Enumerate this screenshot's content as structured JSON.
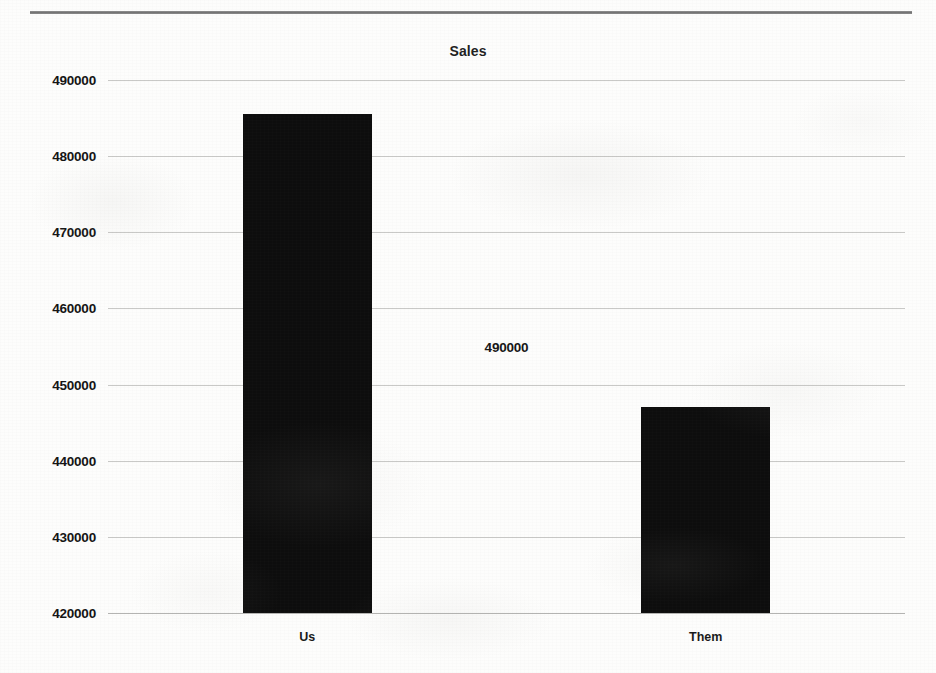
{
  "chart_data": {
    "type": "bar",
    "title": "Sales",
    "categories": [
      "Us",
      "Them"
    ],
    "values": [
      485500,
      447000
    ],
    "xlabel": "",
    "ylabel": "",
    "ylim": [
      420000,
      490000
    ],
    "ytick_labels": [
      "490000",
      "480000",
      "470000",
      "460000",
      "450000",
      "440000",
      "430000",
      "420000"
    ],
    "ytick_values": [
      490000,
      480000,
      470000,
      460000,
      450000,
      440000,
      430000,
      420000
    ],
    "grid": true,
    "legend": false,
    "legend_position": "none",
    "bar_color": "#0d0d0d",
    "gridline_color": "#c9c9c7",
    "annotations": [
      {
        "text": "490000",
        "x_pct": 50.0,
        "y_pct": 50.0
      }
    ]
  },
  "page": {
    "top_rule_color": "#6f6f6f",
    "background_color": "#fdfdfc"
  }
}
